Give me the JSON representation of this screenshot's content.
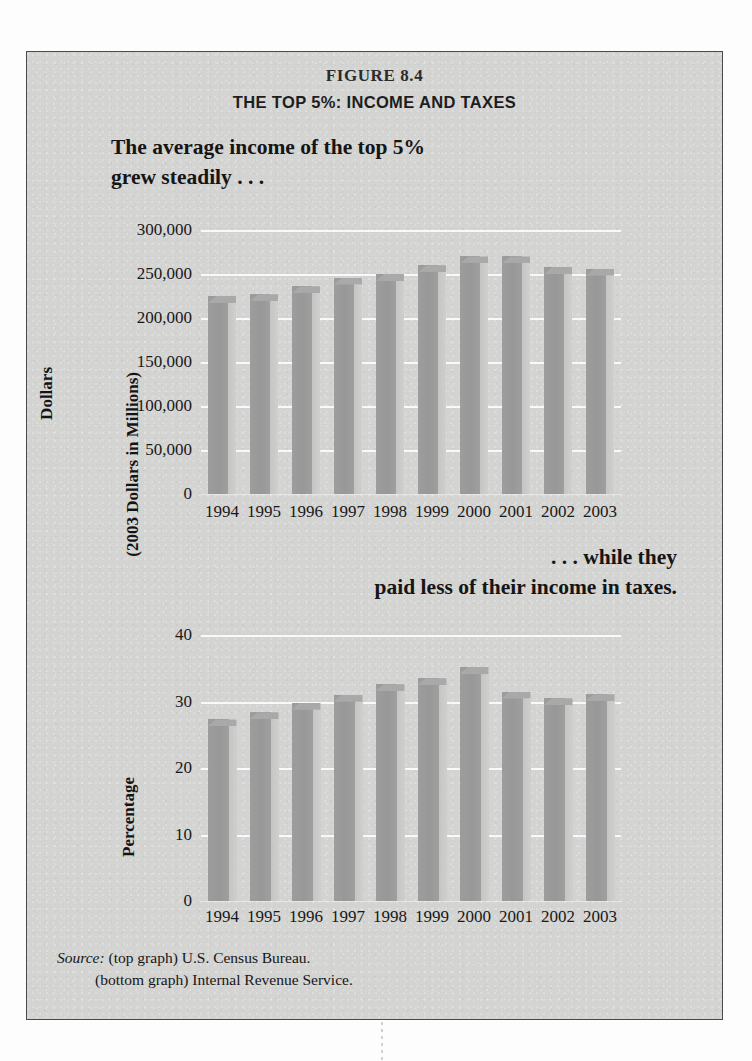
{
  "figure": {
    "number": "FIGURE 8.4",
    "title": "THE TOP 5%: INCOME AND TAXES"
  },
  "captions": {
    "top_line1": "The average income of the top 5%",
    "top_line2": "grew steadily . . .",
    "bottom_line1": ". . . while they",
    "bottom_line2": "paid less of their income in taxes."
  },
  "source": {
    "label": "Source:",
    "line1": "(top graph) U.S. Census Bureau.",
    "line2": "(bottom graph) Internal Revenue Service."
  },
  "colors": {
    "page": "#d6d6d4",
    "bar_face": "#989898",
    "bar_side": "#cacac8",
    "bar_top": "#a9a9a9",
    "gridline": "#fbfbfb",
    "frame": "#4a4a4a",
    "text": "#161616"
  },
  "chart_data": [
    {
      "id": "top-chart",
      "type": "bar",
      "title": "The average income of the top 5% grew steadily . . .",
      "xlabel": "",
      "ylabel": "Dollars",
      "ylabel_line2": "(2003 Dollars in Millions)",
      "categories": [
        "1994",
        "1995",
        "1996",
        "1997",
        "1998",
        "1999",
        "2000",
        "2001",
        "2002",
        "2003"
      ],
      "values": [
        225000,
        227000,
        236000,
        246000,
        250000,
        260000,
        270000,
        270000,
        258000,
        256000
      ],
      "ylim": [
        0,
        300000
      ],
      "yticks": [
        0,
        50000,
        100000,
        150000,
        200000,
        250000,
        300000
      ],
      "ytick_labels": [
        "0",
        "50,000",
        "100,000",
        "150,000",
        "200,000",
        "250,000",
        "300,000"
      ],
      "grid": true,
      "legend": "none",
      "source": "U.S. Census Bureau"
    },
    {
      "id": "bottom-chart",
      "type": "bar",
      "title": ". . . while they paid less of their income in taxes.",
      "xlabel": "",
      "ylabel": "Percentage",
      "categories": [
        "1994",
        "1995",
        "1996",
        "1997",
        "1998",
        "1999",
        "2000",
        "2001",
        "2002",
        "2003"
      ],
      "values": [
        27.3,
        28.4,
        29.8,
        31.0,
        32.6,
        33.5,
        35.2,
        31.5,
        30.5,
        31.1
      ],
      "ylim": [
        0,
        40
      ],
      "yticks": [
        0,
        10,
        20,
        30,
        40
      ],
      "ytick_labels": [
        "0",
        "10",
        "20",
        "30",
        "40"
      ],
      "grid": true,
      "legend": "none",
      "source": "Internal Revenue Service"
    }
  ]
}
